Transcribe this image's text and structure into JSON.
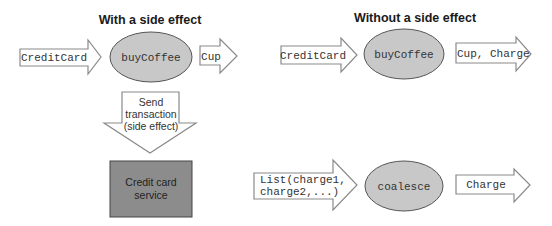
{
  "left": {
    "title": "With a side effect",
    "input_arrow": "CreditCard",
    "function": "buyCoffee",
    "output_arrow": "Cup",
    "side_effect_arrow": [
      "Send",
      "transaction",
      "(side effect)"
    ],
    "service_box": [
      "Credit card",
      "service"
    ]
  },
  "right": {
    "title": "Without a side effect",
    "input_arrow": "CreditCard",
    "function": "buyCoffee",
    "output_arrow": "Cup, Charge",
    "list_arrow": [
      "List(charge1,",
      "charge2,...)"
    ],
    "coalesce_function": "coalesce",
    "charge_arrow": "Charge"
  },
  "colors": {
    "oval_fill": "#c8c8c8",
    "box_fill": "#8c8c8c",
    "arrow_stroke": "#8a8a8a"
  }
}
